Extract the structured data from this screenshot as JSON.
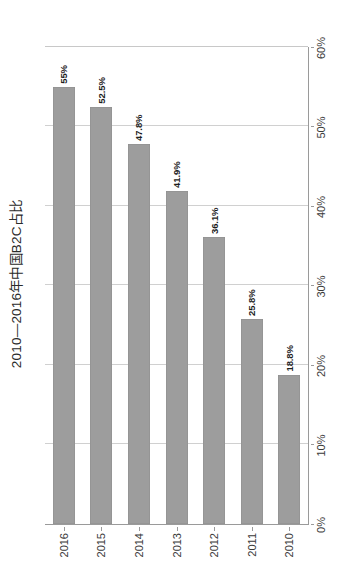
{
  "chart_data": {
    "type": "bar",
    "orientation": "vertical",
    "title": "2010—2016年中国B2C占比",
    "xlabel": "",
    "ylabel": "",
    "categories": [
      "2010",
      "2011",
      "2012",
      "2013",
      "2014",
      "2015",
      "2016"
    ],
    "values": [
      18.8,
      25.8,
      36.1,
      41.9,
      47.8,
      52.5,
      55
    ],
    "data_labels": [
      "18.8%",
      "25.8%",
      "36.1%",
      "41.9%",
      "47.8%",
      "52.5%",
      "55%"
    ],
    "ylim": [
      0,
      60
    ],
    "ytick_values": [
      0,
      10,
      20,
      30,
      40,
      50,
      60
    ],
    "ytick_labels": [
      "0%",
      "10%",
      "20%",
      "30%",
      "40%",
      "50%",
      "60%"
    ],
    "grid": true,
    "legend": false,
    "series": [
      {
        "name": "中国B2C占比",
        "color": "#9d9d9d",
        "values": [
          18.8,
          25.8,
          36.1,
          41.9,
          47.8,
          52.5,
          55
        ]
      }
    ]
  },
  "figure": {
    "background_color": "#ffffff",
    "axis_color": "#9a9a9a",
    "grid_color": "#d0d0d0",
    "bar_color": "#9d9d9d",
    "label_color": "#1d1d1d",
    "rotation_note": "page rendered sideways"
  }
}
